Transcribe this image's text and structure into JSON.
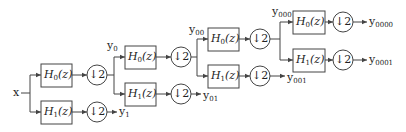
{
  "diagram": {
    "type": "wavelet-packet-filter-bank-tree",
    "input": {
      "label": "x"
    },
    "stage_blocks": {
      "lowpass": {
        "name": "H",
        "sub": "0",
        "arg": "(z)"
      },
      "highpass": {
        "name": "H",
        "sub": "1",
        "arg": "(z)"
      },
      "downsampler": {
        "label": "↓2"
      }
    },
    "outputs": [
      {
        "base": "y",
        "sub": "1"
      },
      {
        "base": "y",
        "sub": "01"
      },
      {
        "base": "y",
        "sub": "001"
      },
      {
        "base": "y",
        "sub": "0000"
      },
      {
        "base": "y",
        "sub": "0001"
      }
    ],
    "intermediates": [
      {
        "base": "y",
        "sub": "0"
      },
      {
        "base": "y",
        "sub": "00"
      },
      {
        "base": "y",
        "sub": "000"
      }
    ],
    "colors": {
      "stroke": "#444444",
      "text": "#222222",
      "background": "#ffffff"
    }
  }
}
